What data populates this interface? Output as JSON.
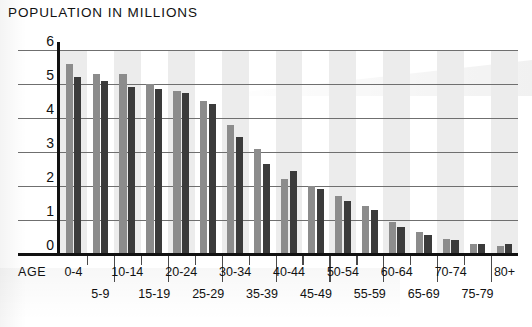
{
  "chart_data": {
    "type": "bar",
    "title": "POPULATION IN MILLIONS",
    "xlabel": "AGE",
    "ylabel": "",
    "ylim": [
      0,
      6
    ],
    "yticks": [
      0,
      1,
      2,
      3,
      4,
      5,
      6
    ],
    "grid": true,
    "legend": "none",
    "categories": [
      "0-4",
      "5-9",
      "10-14",
      "15-19",
      "20-24",
      "25-29",
      "30-34",
      "35-39",
      "40-44",
      "45-49",
      "50-54",
      "55-59",
      "60-64",
      "65-69",
      "70-74",
      "75-79",
      "80+"
    ],
    "series": [
      {
        "name": "light",
        "color": "#8c8c8c",
        "values": [
          5.6,
          5.3,
          5.3,
          5.0,
          4.8,
          4.5,
          3.8,
          3.1,
          2.2,
          2.0,
          1.7,
          1.4,
          0.95,
          0.65,
          0.45,
          0.3,
          0.25
        ]
      },
      {
        "name": "dark",
        "color": "#3b3b3b",
        "values": [
          5.2,
          5.1,
          4.9,
          4.85,
          4.75,
          4.4,
          3.45,
          2.65,
          2.45,
          1.9,
          1.55,
          1.3,
          0.8,
          0.55,
          0.4,
          0.28,
          0.3
        ]
      }
    ]
  },
  "title": "POPULATION IN MILLIONS",
  "axis": {
    "age_caption": "AGE",
    "y_labels": [
      "6",
      "5",
      "4",
      "3",
      "2",
      "1",
      "0"
    ]
  },
  "x_labels_top": [
    "0-4",
    "10-14",
    "20-24",
    "30-34",
    "40-44",
    "50-54",
    "60-64",
    "70-74",
    "80+"
  ],
  "x_labels_bottom": [
    "5-9",
    "15-19",
    "25-29",
    "35-39",
    "45-49",
    "55-59",
    "65-69",
    "75-79"
  ],
  "colors": {
    "bar_light": "#8c8c8c",
    "bar_dark": "#3b3b3b",
    "band": "#ececec",
    "grid": "#6f6f6f",
    "axis": "#111111",
    "background": "#ffffff"
  }
}
